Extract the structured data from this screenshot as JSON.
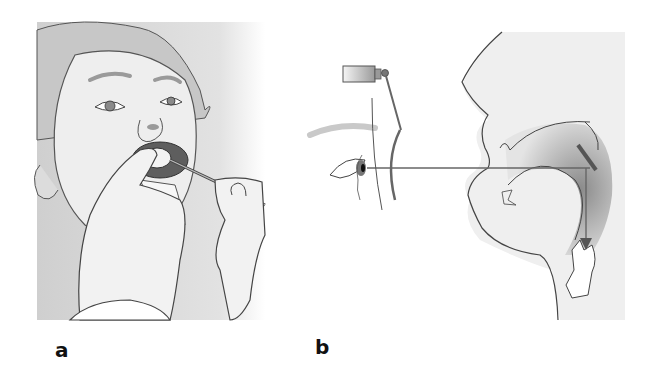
{
  "figure": {
    "panels": [
      {
        "label": "a",
        "description": "Examiner holding a laryngeal mirror inside a patient's open mouth while retracting the tongue with gauze"
      },
      {
        "label": "b",
        "description": "Side view: head mirror light beam from examiner's eye reflects off the laryngeal mirror down toward the larynx"
      }
    ]
  },
  "colors": {
    "line": "#444444",
    "skin_fill": "#e6e6e6",
    "shade": "#b8b8b8",
    "dark": "#6e6e6e",
    "label": "#111111"
  }
}
